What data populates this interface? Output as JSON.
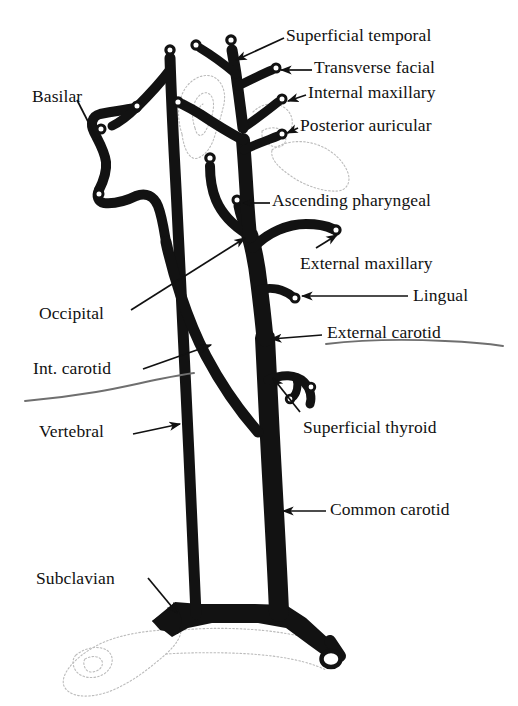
{
  "figure": {
    "type": "anatomical-line-diagram",
    "colors": {
      "vessel_fill": "#121212",
      "lumen_dot": "#ffffff",
      "leader_line": "#111111",
      "text": "#111111",
      "ghost_outline": "#b9b9b9",
      "underline_rule": "#6f6f6f",
      "background": "#ffffff"
    }
  },
  "labels": [
    {
      "id": "superficial-temporal",
      "text": "Superficial temporal",
      "align": "right",
      "x": 286,
      "y": 27
    },
    {
      "id": "transverse-facial",
      "text": "Transverse facial",
      "align": "right",
      "x": 314,
      "y": 59
    },
    {
      "id": "internal-maxillary",
      "text": "Internal maxillary",
      "align": "right",
      "x": 308,
      "y": 84
    },
    {
      "id": "posterior-auricular",
      "text": "Posterior auricular",
      "align": "right",
      "x": 300,
      "y": 117
    },
    {
      "id": "ascending-pharyngeal",
      "text": "Ascending pharyngeal",
      "align": "right",
      "x": 272,
      "y": 192
    },
    {
      "id": "external-maxillary",
      "text": "External maxillary",
      "align": "right",
      "x": 300,
      "y": 255
    },
    {
      "id": "lingual",
      "text": "Lingual",
      "align": "right",
      "x": 413,
      "y": 287
    },
    {
      "id": "external-carotid",
      "text": "External carotid",
      "align": "right",
      "x": 327,
      "y": 324
    },
    {
      "id": "superficial-thyroid",
      "text": "Superficial thyroid",
      "align": "right",
      "x": 303,
      "y": 419
    },
    {
      "id": "common-carotid",
      "text": "Common carotid",
      "align": "right",
      "x": 330,
      "y": 501
    },
    {
      "id": "basilar",
      "text": "Basilar",
      "align": "left",
      "x": 32,
      "y": 88
    },
    {
      "id": "occipital",
      "text": "Occipital",
      "align": "left",
      "x": 39,
      "y": 305
    },
    {
      "id": "int-carotid",
      "text": "Int. carotid",
      "align": "left",
      "x": 33,
      "y": 360
    },
    {
      "id": "vertebral",
      "text": "Vertebral",
      "align": "left",
      "x": 39,
      "y": 423
    },
    {
      "id": "subclavian",
      "text": "Subclavian",
      "align": "left",
      "x": 36,
      "y": 570
    }
  ]
}
